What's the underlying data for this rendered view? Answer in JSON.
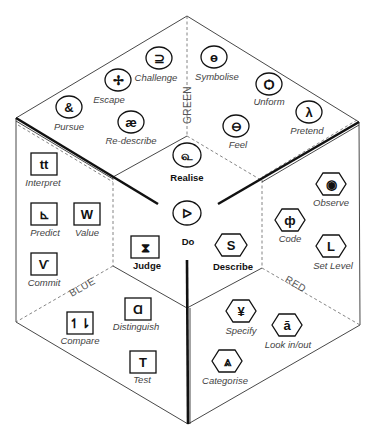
{
  "diagram": {
    "type": "isometric-cube-hexagon",
    "faces": {
      "green": {
        "label": "GREEN",
        "shape": "oval",
        "items": [
          {
            "name": "Challenge",
            "glyph": "⊇",
            "x": 159,
            "y": 58
          },
          {
            "name": "Escape",
            "glyph": "✢",
            "x": 118,
            "y": 80
          },
          {
            "name": "Pursue",
            "glyph": "&",
            "x": 69,
            "y": 107
          },
          {
            "name": "Re-describe",
            "glyph": "æ",
            "x": 131,
            "y": 122
          },
          {
            "name": "Symbolise",
            "glyph": "ɵ",
            "x": 214,
            "y": 57
          },
          {
            "name": "Unform",
            "glyph": "Ѻ",
            "x": 269,
            "y": 84
          },
          {
            "name": "Pretend",
            "glyph": "λ",
            "x": 309,
            "y": 112
          },
          {
            "name": "Feel",
            "glyph": "⊖",
            "x": 236,
            "y": 126
          }
        ]
      },
      "blue": {
        "label": "BLUE",
        "shape": "square",
        "items": [
          {
            "name": "Interpret",
            "glyph": "tt",
            "x": 44,
            "y": 164
          },
          {
            "name": "Predict",
            "glyph": "⊾",
            "x": 44,
            "y": 214
          },
          {
            "name": "Value",
            "glyph": "W",
            "x": 87,
            "y": 214
          },
          {
            "name": "Commit",
            "glyph": "Ѵ",
            "x": 44,
            "y": 264
          },
          {
            "name": "Distinguish",
            "glyph": "Ɑ",
            "x": 138,
            "y": 308
          },
          {
            "name": "Compare",
            "glyph": "↿⇂",
            "x": 80,
            "y": 322
          },
          {
            "name": "Test",
            "glyph": "T",
            "x": 143,
            "y": 361
          }
        ]
      },
      "red": {
        "label": "RED",
        "shape": "hexagon",
        "items": [
          {
            "name": "Observe",
            "glyph": "◉",
            "x": 331,
            "y": 184
          },
          {
            "name": "Code",
            "glyph": "ф",
            "x": 290,
            "y": 220
          },
          {
            "name": "Set Level",
            "glyph": "L",
            "x": 331,
            "y": 246
          },
          {
            "name": "Specify",
            "glyph": "¥",
            "x": 241,
            "y": 311
          },
          {
            "name": "Look in/out",
            "glyph": "ā",
            "x": 287,
            "y": 325
          },
          {
            "name": "Categorise",
            "glyph": "⩓",
            "x": 227,
            "y": 361
          }
        ]
      }
    },
    "center": {
      "realise": {
        "name": "Realise",
        "glyph": "௳",
        "shape": "oval"
      },
      "do": {
        "name": "Do",
        "glyph": "ᐅ",
        "shape": "oval"
      },
      "judge": {
        "name": "Judge",
        "glyph": "⧗",
        "shape": "square"
      },
      "describe": {
        "name": "Describe",
        "glyph": "S",
        "shape": "hexagon"
      }
    }
  }
}
